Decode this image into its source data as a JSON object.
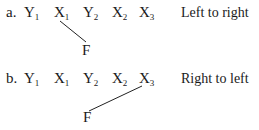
{
  "diagram": {
    "rows": [
      {
        "label": "a.",
        "tokens": [
          {
            "letter": "Y",
            "sub": "1"
          },
          {
            "letter": "X",
            "sub": "1"
          },
          {
            "letter": "Y",
            "sub": "2"
          },
          {
            "letter": "X",
            "sub": "2"
          },
          {
            "letter": "X",
            "sub": "3"
          }
        ],
        "factor": "F",
        "connects_to": "X1",
        "direction": "Left to right"
      },
      {
        "label": "b.",
        "tokens": [
          {
            "letter": "Y",
            "sub": "1"
          },
          {
            "letter": "X",
            "sub": "1"
          },
          {
            "letter": "Y",
            "sub": "2"
          },
          {
            "letter": "X",
            "sub": "2"
          },
          {
            "letter": "X",
            "sub": "3"
          }
        ],
        "factor": "F",
        "connects_to": "X3",
        "direction": "Right to left"
      }
    ],
    "line_color": "#222222"
  }
}
